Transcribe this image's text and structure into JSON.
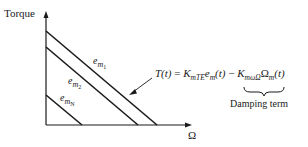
{
  "diagram": {
    "type": "torque-speed characteristic",
    "axes": {
      "y_label": "Torque",
      "x_label": "Ω"
    },
    "curves": [
      {
        "id": "em1",
        "base": "e",
        "sub": "m",
        "subsub": "1"
      },
      {
        "id": "em2",
        "base": "e",
        "sub": "m",
        "subsub": "2"
      },
      {
        "id": "emN",
        "base": "e",
        "sub": "m",
        "subsub": "N"
      }
    ],
    "equation": {
      "lhs": "T(t)",
      "equals": " = ",
      "k1": "K",
      "k1_sub": "mTE",
      "e": "e",
      "e_sub": "m",
      "t1": "(t)",
      "minus": " − ",
      "k2": "K",
      "k2_sub": "mωΩ",
      "omega": "Ω",
      "omega_sub": "m",
      "t2": "(t)"
    },
    "annotation": {
      "damping_label": "Damping term"
    },
    "colors": {
      "ink": "#1a1a1a",
      "background": "#ffffff"
    }
  }
}
